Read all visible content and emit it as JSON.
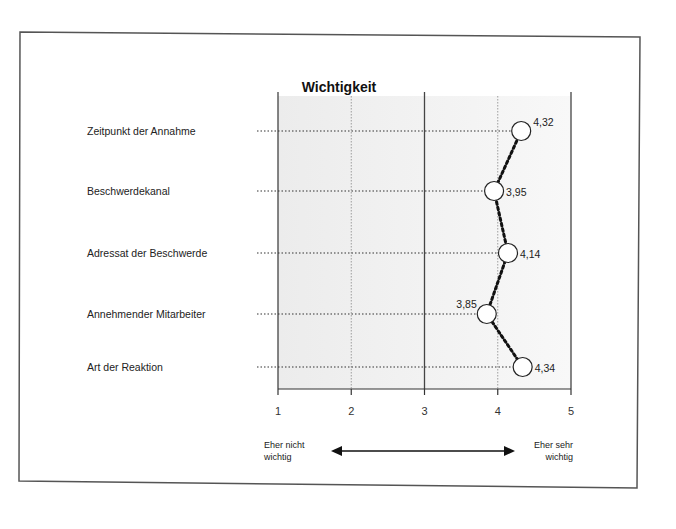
{
  "chart_data": {
    "type": "line",
    "title": "Wichtigkeit",
    "categories": [
      "Zeitpunkt der Annahme",
      "Beschwerdekanal",
      "Adressat der Beschwerde",
      "Annehmender Mitarbeiter",
      "Art der Reaktion"
    ],
    "values": [
      4.32,
      3.95,
      4.14,
      3.85,
      4.34
    ],
    "value_labels": [
      "4,32",
      "3,95",
      "4,14",
      "3,85",
      "4,34"
    ],
    "xlim": [
      1,
      5
    ],
    "xticks": [
      "1",
      "2",
      "3",
      "4",
      "5"
    ],
    "xlabel_left": "Eher nicht wichtig",
    "xlabel_right": "Eher sehr wichtig",
    "orientation": "horizontal profile",
    "grid": true
  },
  "title": "Wichtigkeit",
  "scale": {
    "left_label_line1": "Eher nicht",
    "left_label_line2": "wichtig",
    "right_label_line1": "Eher sehr",
    "right_label_line2": "wichtig"
  }
}
